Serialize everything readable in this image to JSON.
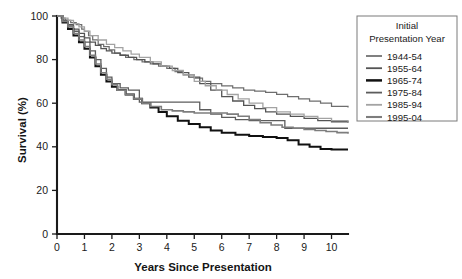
{
  "chart_data": {
    "type": "line",
    "title": "",
    "xlabel": "Years Since Presentation",
    "ylabel": "Survival (%)",
    "xlim": [
      0,
      10.6
    ],
    "ylim": [
      0,
      100
    ],
    "xticks": [
      "0",
      "1",
      "2",
      "3",
      "4",
      "5",
      "6",
      "7",
      "8",
      "9",
      "10"
    ],
    "yticks": [
      "0",
      "20",
      "40",
      "60",
      "80",
      "100"
    ],
    "grid": false,
    "legend_position": "right-top",
    "legend_title_lines": [
      "Initial",
      "Presentation Year"
    ],
    "series": [
      {
        "name": "1944-54",
        "color": "#6e6e6e",
        "width": 1.25,
        "x": [
          0,
          0.15,
          0.3,
          0.5,
          0.7,
          0.9,
          1.0,
          1.15,
          1.3,
          1.5,
          1.7,
          1.9,
          2.1,
          2.3,
          2.5,
          2.8,
          3.1,
          3.4,
          3.7,
          4.0,
          4.3,
          4.6,
          5.0,
          5.3,
          5.6,
          6.0,
          6.4,
          6.8,
          7.2,
          7.6,
          8.0,
          8.4,
          8.8,
          9.2,
          9.6,
          10.0,
          10.6
        ],
        "y": [
          100,
          99,
          98,
          97,
          96,
          94,
          93,
          91,
          89,
          87,
          86,
          84.5,
          83,
          82,
          81,
          80,
          79,
          78,
          77,
          76,
          74.5,
          73,
          71.5,
          70,
          69,
          68,
          67,
          66,
          65.5,
          65,
          64,
          63,
          62,
          61,
          60,
          58.5,
          58
        ]
      },
      {
        "name": "1955-64",
        "color": "#545454",
        "width": 1.3,
        "x": [
          0,
          0.2,
          0.4,
          0.6,
          0.8,
          1.0,
          1.2,
          1.4,
          1.6,
          1.8,
          2.0,
          2.3,
          2.6,
          2.9,
          3.2,
          3.5,
          3.8,
          4.1,
          4.4,
          4.8,
          5.2,
          5.6,
          6.0,
          6.4,
          6.8,
          7.2,
          7.6,
          8.0,
          8.5,
          9.0,
          9.5,
          10.0,
          10.6
        ],
        "y": [
          100,
          98,
          96,
          94,
          92,
          90,
          88,
          86.5,
          85,
          84,
          83,
          82,
          81,
          80,
          79,
          78,
          77,
          76,
          74,
          72,
          69,
          66,
          63,
          61,
          59,
          57.5,
          56,
          55,
          54,
          53,
          52,
          51.5,
          51
        ]
      },
      {
        "name": "1965-74",
        "color": "#111111",
        "width": 2.0,
        "x": [
          0,
          0.2,
          0.4,
          0.6,
          0.8,
          1.0,
          1.2,
          1.4,
          1.6,
          1.8,
          2.0,
          2.2,
          2.5,
          2.8,
          3.1,
          3.4,
          3.7,
          4.0,
          4.4,
          4.8,
          5.2,
          5.6,
          6.0,
          6.5,
          7.0,
          7.5,
          8.0,
          8.4,
          8.8,
          9.2,
          9.6,
          10.0,
          10.6
        ],
        "y": [
          100,
          97,
          94,
          91,
          88,
          85,
          81,
          77,
          73,
          70,
          67.5,
          66,
          64,
          62,
          60,
          58,
          56,
          54,
          52,
          50.5,
          49,
          47.5,
          46.5,
          45.5,
          45,
          44.5,
          44,
          43,
          41,
          40,
          39,
          38.8,
          38.8
        ]
      },
      {
        "name": "1975-84",
        "color": "#5c5c5c",
        "width": 1.3,
        "x": [
          0,
          0.2,
          0.4,
          0.6,
          0.8,
          1.0,
          1.2,
          1.4,
          1.6,
          1.8,
          2.0,
          2.3,
          2.6,
          2.9,
          3.0,
          3.3,
          3.6,
          4.0,
          4.4,
          4.8,
          5.2,
          5.6,
          6.0,
          6.5,
          7.0,
          7.5,
          8.0,
          8.3,
          8.6,
          9.0,
          9.5,
          10.0,
          10.6
        ],
        "y": [
          100,
          98,
          95.5,
          93,
          90.5,
          88,
          84,
          80,
          76,
          72,
          69,
          67,
          66,
          66,
          60.5,
          60.5,
          60.5,
          60.5,
          60.5,
          60.5,
          57,
          55,
          53.5,
          52.5,
          52,
          52,
          52,
          48.5,
          48.5,
          48.5,
          48.5,
          48.5,
          48.5
        ]
      },
      {
        "name": "1985-94",
        "color": "#a3a3a3",
        "width": 1.3,
        "x": [
          0,
          0.2,
          0.4,
          0.6,
          0.8,
          1.0,
          1.2,
          1.5,
          1.8,
          2.1,
          2.4,
          2.7,
          3.0,
          3.4,
          3.8,
          4.2,
          4.6,
          5.0,
          5.4,
          5.8,
          6.2,
          6.6,
          7.0,
          7.5,
          8.0,
          8.5,
          9.0,
          9.5,
          10.0,
          10.6
        ],
        "y": [
          100,
          99,
          98,
          96.5,
          95,
          93,
          91,
          89,
          87,
          85.5,
          84,
          82.5,
          81,
          79,
          77,
          75,
          73,
          70,
          68,
          66,
          64,
          62,
          60,
          58,
          56,
          55,
          54,
          53,
          52,
          51.5
        ]
      },
      {
        "name": "1995-04",
        "color": "#7d7d7d",
        "width": 1.6,
        "x": [
          0,
          0.2,
          0.4,
          0.6,
          0.8,
          1.0,
          1.2,
          1.4,
          1.6,
          1.8,
          2.0,
          2.2,
          2.5,
          2.8,
          3.1,
          3.4,
          3.8,
          4.2,
          4.6,
          5.0,
          5.4,
          5.8,
          6.2,
          6.6,
          7.0,
          7.4,
          7.8,
          8.2,
          8.6,
          9.0,
          9.4,
          9.8,
          10.2,
          10.6
        ],
        "y": [
          100,
          97.5,
          95,
          92,
          89,
          86,
          82,
          78,
          74,
          71,
          68.5,
          66,
          64,
          62,
          60,
          58.5,
          57,
          56.5,
          56,
          55.5,
          55.5,
          55.5,
          55,
          54,
          52.5,
          51,
          50,
          49,
          48.5,
          48,
          47.5,
          47,
          46.5,
          46
        ]
      }
    ]
  }
}
